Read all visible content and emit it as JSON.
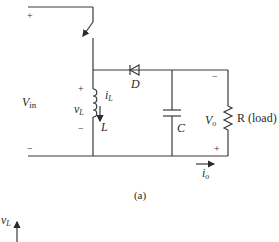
{
  "figure": {
    "caption": "(a)",
    "source": {
      "label_main": "V",
      "label_sub": "in",
      "plus": "+",
      "minus": "−"
    },
    "switch": {
      "name": "switch"
    },
    "inductor": {
      "label": "L",
      "voltage_label_main": "v",
      "voltage_label_sub": "L",
      "current_label_main": "i",
      "current_label_sub": "L",
      "plus": "+",
      "minus": "−"
    },
    "diode": {
      "label": "D"
    },
    "capacitor": {
      "label": "C"
    },
    "load": {
      "label": "R (load)",
      "voltage_label_main": "V",
      "voltage_label_sub": "o",
      "plus": "+",
      "minus": "−"
    },
    "output_current": {
      "label_main": "i",
      "label_sub": "o"
    },
    "waveform_axis": {
      "label_main": "v",
      "label_sub": "L"
    }
  }
}
